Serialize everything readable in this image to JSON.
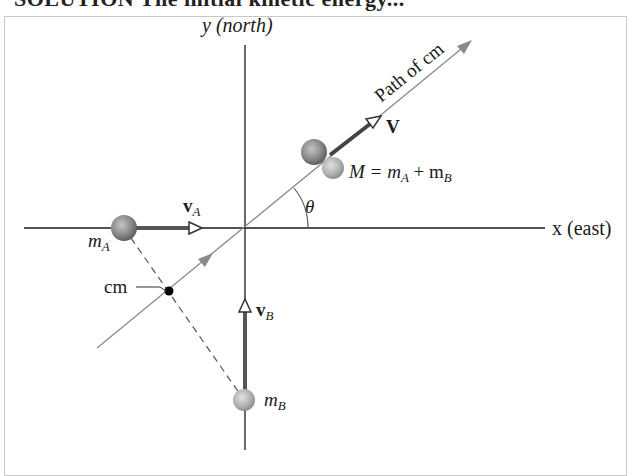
{
  "header": {
    "cut_title": "SOLUTION The initial kinetic energy..."
  },
  "axes": {
    "y_label": "y (north)",
    "x_label": "x (east)"
  },
  "labels": {
    "path": "Path of cm",
    "V": "V",
    "M_eq": "M = m",
    "M_sub_A": "A",
    "plus": " + m",
    "M_sub_B": "B",
    "theta": "θ",
    "vA": "v",
    "vA_sub": "A",
    "mA": "m",
    "mA_sub": "A",
    "cm": "cm",
    "vB": "v",
    "vB_sub": "B",
    "mB": "m",
    "mB_sub": "B"
  },
  "colors": {
    "axis": "#1a1a1a",
    "path": "#8a8a8a",
    "vector": "#555555",
    "sphere_dark": "#6e6e6e",
    "sphere_light": "#b0b0b0",
    "frame": "#c8c8c8"
  }
}
